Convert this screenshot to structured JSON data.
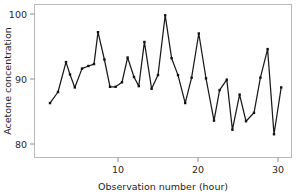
{
  "chart_data": {
    "type": "line",
    "title": "",
    "subtitle": "",
    "xlabel": "Observation number (hour)",
    "ylabel": "Acetone concentration",
    "xlim": [
      0.5,
      31.5
    ],
    "ylim": [
      78.0,
      101.0
    ],
    "xticks": [
      10,
      20,
      30
    ],
    "xtick_labels": [
      "10",
      "20",
      "30"
    ],
    "yticks": [
      80,
      90,
      100
    ],
    "ytick_labels": [
      "80",
      "90",
      "100"
    ],
    "grid": false,
    "legend": null,
    "markers": "filled-square",
    "line_color": "#1a1a1a",
    "marker_color": "#111111",
    "frame_color": "#b9b9b9",
    "x": [
      1.5,
      2.5,
      3.5,
      4.0,
      4.6,
      5.5,
      6.3,
      7.0,
      7.5,
      8.3,
      9.0,
      9.7,
      10.5,
      11.2,
      12.0,
      12.6,
      13.3,
      14.2,
      15.0,
      15.9,
      16.7,
      17.5,
      18.4,
      19.2,
      20.1,
      21.0,
      22.0,
      22.7,
      23.6,
      24.3,
      25.2,
      26.0,
      27.0,
      27.8,
      28.7,
      29.5,
      30.4
    ],
    "y": [
      86.3,
      88.0,
      92.6,
      90.7,
      88.7,
      91.6,
      92.0,
      92.3,
      97.2,
      93.0,
      88.8,
      88.8,
      89.5,
      93.3,
      90.3,
      88.9,
      95.7,
      88.5,
      90.6,
      99.8,
      93.2,
      90.6,
      86.3,
      90.2,
      97.0,
      90.1,
      83.6,
      88.3,
      89.9,
      82.2,
      87.6,
      83.5,
      84.8,
      90.2,
      94.6,
      81.5,
      88.7
    ],
    "series_name": "Acetone concentration",
    "n_points": 37,
    "y_min_observed": 81.5,
    "y_max_observed": 99.8
  },
  "figure": {
    "background": "#ffffff",
    "axis_label_x": "Observation number (hour)",
    "axis_label_y": "Acetone concentration"
  }
}
